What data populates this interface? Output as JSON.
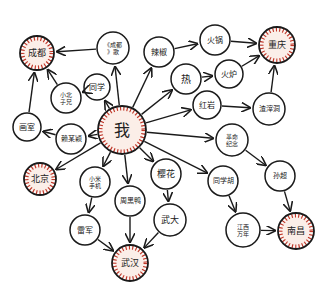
{
  "colors": {
    "background": "#ffffff",
    "stroke": "#1a1a1a",
    "highlight_fill": "#fbeee8",
    "highlight_ring": "#c0392b"
  },
  "nodes": [
    {
      "id": "wo",
      "label": "我",
      "x": 122,
      "y": 130,
      "r": 24,
      "highlight": true,
      "font": 16
    },
    {
      "id": "chengdu",
      "label": "成都",
      "x": 37,
      "y": 53,
      "r": 17,
      "highlight": true,
      "font": 9
    },
    {
      "id": "chengdu_song",
      "label": "《成都》歌",
      "x": 113,
      "y": 48,
      "r": 16,
      "highlight": false,
      "font": 6
    },
    {
      "id": "tongxue",
      "label": "同学",
      "x": 97,
      "y": 87,
      "r": 13,
      "highlight": false,
      "font": 8
    },
    {
      "id": "xiaobei",
      "label": "小北子兄",
      "x": 66,
      "y": 98,
      "r": 15,
      "highlight": false,
      "font": 6
    },
    {
      "id": "huashi",
      "label": "画室",
      "x": 27,
      "y": 127,
      "r": 14,
      "highlight": false,
      "font": 8
    },
    {
      "id": "laimouying",
      "label": "赖某颖",
      "x": 71,
      "y": 139,
      "r": 15,
      "highlight": false,
      "font": 7
    },
    {
      "id": "beijing",
      "label": "北京",
      "x": 40,
      "y": 179,
      "r": 16,
      "highlight": true,
      "font": 9
    },
    {
      "id": "xiaomi",
      "label": "小米手机",
      "x": 95,
      "y": 182,
      "r": 15,
      "highlight": false,
      "font": 6
    },
    {
      "id": "leijun",
      "label": "雷军",
      "x": 85,
      "y": 230,
      "r": 15,
      "highlight": false,
      "font": 8
    },
    {
      "id": "zhouheiya",
      "label": "周黑鸭",
      "x": 130,
      "y": 201,
      "r": 15,
      "highlight": false,
      "font": 7
    },
    {
      "id": "wuhan",
      "label": "武汉",
      "x": 130,
      "y": 263,
      "r": 18,
      "highlight": true,
      "font": 9
    },
    {
      "id": "yinghua",
      "label": "樱花",
      "x": 166,
      "y": 174,
      "r": 15,
      "highlight": false,
      "font": 9
    },
    {
      "id": "wuda",
      "label": "武大",
      "x": 170,
      "y": 220,
      "r": 16,
      "highlight": false,
      "font": 9
    },
    {
      "id": "lajiao",
      "label": "辣椒",
      "x": 159,
      "y": 52,
      "r": 15,
      "highlight": false,
      "font": 8
    },
    {
      "id": "huoguo",
      "label": "火锅",
      "x": 215,
      "y": 40,
      "r": 15,
      "highlight": false,
      "font": 8
    },
    {
      "id": "chongqing",
      "label": "重庆",
      "x": 277,
      "y": 45,
      "r": 18,
      "highlight": true,
      "font": 9
    },
    {
      "id": "re",
      "label": "热",
      "x": 186,
      "y": 79,
      "r": 15,
      "highlight": false,
      "font": 10
    },
    {
      "id": "huolu",
      "label": "火炉",
      "x": 229,
      "y": 74,
      "r": 14,
      "highlight": false,
      "font": 8
    },
    {
      "id": "hongyan",
      "label": "红岩",
      "x": 207,
      "y": 105,
      "r": 14,
      "highlight": false,
      "font": 8
    },
    {
      "id": "zhazidong",
      "label": "渣滓洞",
      "x": 269,
      "y": 109,
      "r": 16,
      "highlight": false,
      "font": 7
    },
    {
      "id": "geming",
      "label": "革命纪念",
      "x": 232,
      "y": 140,
      "r": 16,
      "highlight": false,
      "font": 6
    },
    {
      "id": "tongxuehu",
      "label": "同学胡",
      "x": 223,
      "y": 181,
      "r": 15,
      "highlight": false,
      "font": 7
    },
    {
      "id": "sunchao",
      "label": "孙超",
      "x": 280,
      "y": 176,
      "r": 15,
      "highlight": false,
      "font": 7
    },
    {
      "id": "jiangxi",
      "label": "江西万年",
      "x": 243,
      "y": 230,
      "r": 17,
      "highlight": false,
      "font": 6
    },
    {
      "id": "nanchang",
      "label": "南昌",
      "x": 296,
      "y": 231,
      "r": 18,
      "highlight": true,
      "font": 9
    }
  ],
  "edges": [
    [
      "chengdu_song",
      "chengdu"
    ],
    [
      "wo",
      "chengdu_song"
    ],
    [
      "wo",
      "tongxue"
    ],
    [
      "tongxue",
      "xiaobei"
    ],
    [
      "xiaobei",
      "chengdu"
    ],
    [
      "huashi",
      "chengdu"
    ],
    [
      "laimouying",
      "huashi"
    ],
    [
      "wo",
      "laimouying"
    ],
    [
      "wo",
      "beijing"
    ],
    [
      "wo",
      "xiaomi"
    ],
    [
      "xiaomi",
      "leijun"
    ],
    [
      "leijun",
      "wuhan"
    ],
    [
      "wo",
      "zhouheiya"
    ],
    [
      "zhouheiya",
      "wuhan"
    ],
    [
      "wo",
      "yinghua"
    ],
    [
      "yinghua",
      "wuda"
    ],
    [
      "wuda",
      "wuhan"
    ],
    [
      "wo",
      "lajiao"
    ],
    [
      "lajiao",
      "huoguo"
    ],
    [
      "huoguo",
      "chongqing"
    ],
    [
      "wo",
      "re"
    ],
    [
      "re",
      "huolu"
    ],
    [
      "huolu",
      "chongqing"
    ],
    [
      "wo",
      "hongyan"
    ],
    [
      "hongyan",
      "zhazidong"
    ],
    [
      "zhazidong",
      "chongqing"
    ],
    [
      "wo",
      "geming"
    ],
    [
      "geming",
      "sunchao"
    ],
    [
      "sunchao",
      "nanchang"
    ],
    [
      "wo",
      "tongxuehu"
    ],
    [
      "tongxuehu",
      "jiangxi"
    ],
    [
      "jiangxi",
      "nanchang"
    ]
  ]
}
